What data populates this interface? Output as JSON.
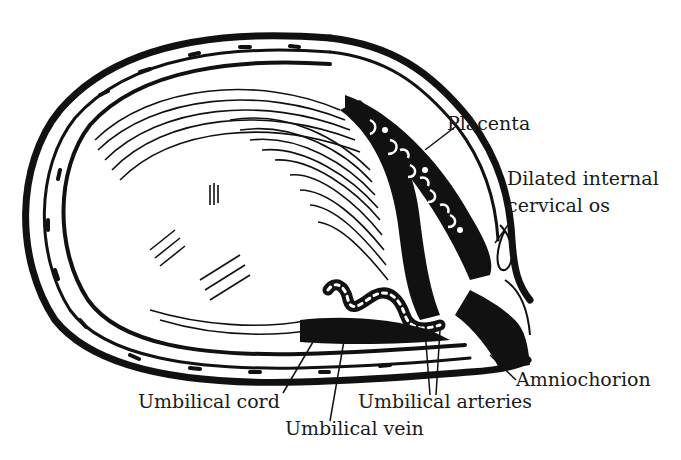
{
  "diagram": {
    "colors": {
      "ink": "#111111",
      "paper": "#ffffff",
      "text": "#1a1a1a"
    },
    "labels": {
      "placenta": "Placenta",
      "dilated_os_line1": "Dilated internal",
      "dilated_os_line2": "cervical os",
      "amniochorion": "Amniochorion",
      "umbilical_cord": "Umbilical cord",
      "umbilical_arteries": "Umbilical arteries",
      "umbilical_vein": "Umbilical vein"
    }
  }
}
